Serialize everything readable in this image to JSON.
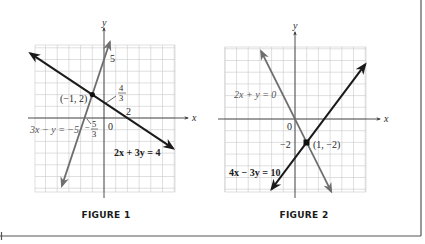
{
  "colors": {
    "dark_line": "#1a1a1a",
    "grey_line": "#6e6e6e",
    "grid": "#c9c9c9",
    "axis": "#3a3a3a",
    "frame": "#555555"
  },
  "figures": [
    {
      "caption": "FIGURE 1",
      "axis_labels": {
        "x": "x",
        "y": "y"
      },
      "origin_label": "0",
      "tick_labels": {
        "y_five": "5",
        "x_two": "2"
      },
      "annotations": {
        "y_intercept_num": "4",
        "y_intercept_den": "3",
        "x_intercept_sign": "−",
        "x_intercept_num": "5",
        "x_intercept_den": "3",
        "intersection": "(−1, 2)"
      },
      "equations": {
        "dark": "2x + 3y = 4",
        "grey": "3x − y = −5"
      }
    },
    {
      "caption": "FIGURE 2",
      "axis_labels": {
        "x": "x",
        "y": "y"
      },
      "origin_label": "0",
      "tick_labels": {
        "y_neg_two": "−2"
      },
      "annotations": {
        "intersection": "(1, −2)"
      },
      "equations": {
        "grey": "2x + y = 0",
        "dark": "4x − 3y = 10"
      }
    }
  ],
  "chart_data": [
    {
      "type": "line",
      "title": "FIGURE 1",
      "xlabel": "x",
      "ylabel": "y",
      "xlim": [
        -6,
        6
      ],
      "ylim": [
        -6.3,
        6.2
      ],
      "grid": true,
      "series": [
        {
          "name": "2x + 3y = 4",
          "color": "#1a1a1a",
          "slope": -0.6667,
          "intercept": 1.3333,
          "x": [
            -6.3,
            5.9
          ],
          "y": [
            5.53,
            -2.6
          ]
        },
        {
          "name": "3x − y = −5",
          "color": "#6e6e6e",
          "slope": 3,
          "intercept": 5,
          "x": [
            -3.6,
            0.5
          ],
          "y": [
            -5.8,
            6.5
          ]
        }
      ],
      "points": [
        {
          "label": "(−1, 2)",
          "x": -1,
          "y": 2
        }
      ],
      "annotations": [
        "4/3 (y-intercept of 2x+3y=4)",
        "2 (x-intercept of 2x+3y=4)",
        "−5/3 (x-intercept of 3x−y=−5)",
        "5 (y-intercept of 3x−y=−5)"
      ]
    },
    {
      "type": "line",
      "title": "FIGURE 2",
      "xlabel": "x",
      "ylabel": "y",
      "xlim": [
        -6,
        6
      ],
      "ylim": [
        -6.3,
        6.2
      ],
      "grid": true,
      "series": [
        {
          "name": "2x + y = 0",
          "color": "#6e6e6e",
          "slope": -2,
          "intercept": 0,
          "x": [
            -2.9,
            3.1
          ],
          "y": [
            5.8,
            -6.2
          ]
        },
        {
          "name": "4x − 3y = 10",
          "color": "#1a1a1a",
          "slope": 1.3333,
          "intercept": -3.3333,
          "x": [
            -2,
            6
          ],
          "y": [
            -6,
            4.67
          ]
        }
      ],
      "points": [
        {
          "label": "(1, −2)",
          "x": 1,
          "y": -2
        }
      ],
      "annotations": [
        "−2 (y-intercept label)"
      ]
    }
  ]
}
